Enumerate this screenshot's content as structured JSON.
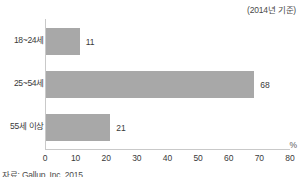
{
  "note": "(2014년 기준)",
  "source": "자료: Gallup, Inc. 2015",
  "unit_label": "%",
  "colors": {
    "bar": "#a8a8a8",
    "axis": "#c9c9c9",
    "text": "#3a3a3a"
  },
  "chart_data": {
    "type": "bar",
    "orientation": "horizontal",
    "title": "",
    "subtitle": "(2014년 기준)",
    "xlabel": "%",
    "ylabel": "",
    "categories": [
      "18~24세",
      "25~54세",
      "55세 이상"
    ],
    "values": [
      11,
      68,
      21
    ],
    "value_labels": [
      "11",
      "68",
      "21"
    ],
    "xlim": [
      0,
      80
    ],
    "xticks": [
      0,
      10,
      20,
      30,
      40,
      50,
      60,
      70,
      80
    ],
    "xtick_labels": [
      "0",
      "10",
      "20",
      "30",
      "40",
      "50",
      "60",
      "70",
      "80"
    ],
    "grid": false,
    "legend": false,
    "bar_color": "#a8a8a8"
  }
}
